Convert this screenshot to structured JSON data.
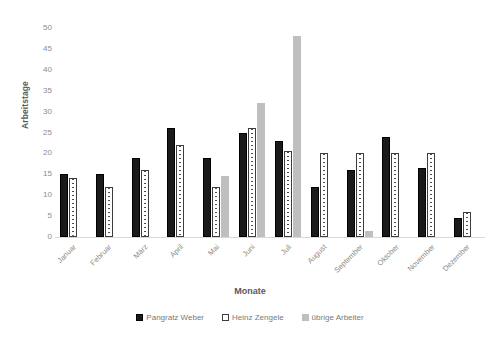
{
  "chart_data": {
    "type": "bar",
    "title": "",
    "xlabel": "Monate",
    "ylabel": "Arbeitstage",
    "ylim": [
      0,
      50
    ],
    "yticks": [
      0,
      5,
      10,
      15,
      20,
      25,
      30,
      35,
      40,
      45,
      50
    ],
    "grid": false,
    "legend_position": "bottom",
    "categories": [
      "Januar",
      "Februar",
      "März",
      "April",
      "Mai",
      "Juni",
      "Juli",
      "August",
      "September",
      "Oktober",
      "November",
      "Dezember"
    ],
    "series": [
      {
        "name": "Pangratz Weber",
        "color": "#1a1a1a",
        "values": [
          15,
          15,
          19,
          26,
          19,
          25,
          23,
          12,
          16,
          24,
          16.5,
          4.5
        ]
      },
      {
        "name": "Heinz Zengele",
        "color": "#ffffff",
        "values": [
          14,
          12,
          16,
          22,
          12,
          26,
          20.5,
          20,
          20,
          20,
          20,
          6
        ]
      },
      {
        "name": "übrige Arbeiter",
        "color": "#bfbfbf",
        "values": [
          null,
          null,
          null,
          null,
          14.5,
          32,
          48,
          null,
          1.5,
          null,
          null,
          null
        ]
      }
    ]
  }
}
